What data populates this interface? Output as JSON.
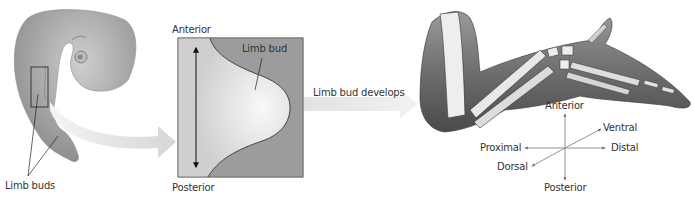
{
  "panels": {
    "embryo": {
      "callout_label": "Limb buds"
    },
    "limb_bud_box": {
      "top_label": "Anterior",
      "bottom_label": "Posterior",
      "bud_label": "Limb bud"
    },
    "transition_arrow": {
      "label": "Limb bud develops"
    },
    "developed_limb": {
      "axes": {
        "anterior": "Anterior",
        "posterior": "Posterior",
        "proximal": "Proximal",
        "distal": "Distal",
        "ventral": "Ventral",
        "dorsal": "Dorsal"
      }
    }
  },
  "colors": {
    "tissue_dark": "#7a7a7a",
    "tissue_mid": "#a9a9a9",
    "tissue_light": "#e6e6e6",
    "arrow_fill": "#dcdcdc",
    "line": "#222222",
    "text": "#333333"
  }
}
